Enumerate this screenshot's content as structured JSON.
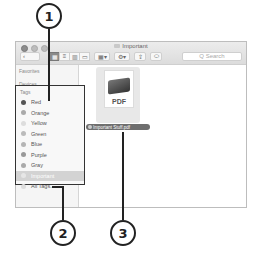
{
  "callouts": [
    "1",
    "2",
    "3"
  ],
  "window": {
    "title": "Important",
    "toolbar": {
      "back": "‹",
      "forward": "›",
      "view_icons": [
        "▦",
        "≡",
        "▥",
        "▭"
      ],
      "arrange": "▦▾",
      "action": "⚙▾",
      "share": "⇪",
      "tags": "⬭",
      "search_placeholder": "Q Search"
    },
    "sidebar": {
      "sections": [
        "Favorites",
        "Devices",
        "Shared"
      ],
      "tags_header": "Tags",
      "tags": [
        {
          "label": "Red",
          "color": "#555555"
        },
        {
          "label": "Orange",
          "color": "#aaaaaa"
        },
        {
          "label": "Yellow",
          "color": "#dddddd"
        },
        {
          "label": "Green",
          "color": "#bbbbbb"
        },
        {
          "label": "Blue",
          "color": "#b5b5b5"
        },
        {
          "label": "Purple",
          "color": "#999999"
        },
        {
          "label": "Gray",
          "color": "#aaaaaa"
        },
        {
          "label": "Important",
          "color": "#e6e6e6",
          "selected": true
        },
        {
          "label": "All Tags...",
          "color": "#dddddd"
        }
      ]
    },
    "content": {
      "file": {
        "type_label": "PDF",
        "name": "Important Stuff.pdf"
      }
    }
  }
}
